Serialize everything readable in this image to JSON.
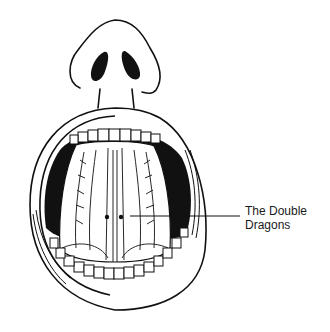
{
  "figure": {
    "annotation": {
      "line1": "The Double",
      "line2": "Dragons"
    },
    "colors": {
      "ink": "#111111",
      "background": "#ffffff"
    }
  }
}
